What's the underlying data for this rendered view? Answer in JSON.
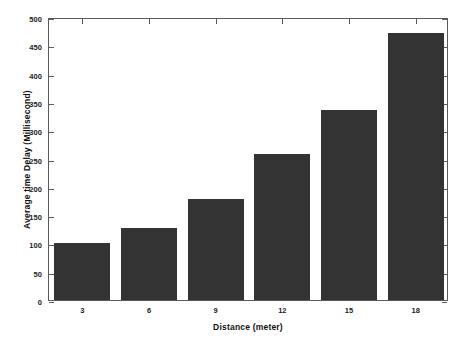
{
  "chart_data": {
    "type": "bar",
    "title": "",
    "xlabel": "Distance (meter)",
    "ylabel": "Average time Delay (Millisecond)",
    "categories": [
      "3",
      "6",
      "9",
      "12",
      "15",
      "18"
    ],
    "values": [
      100,
      128,
      178,
      258,
      335,
      472
    ],
    "series": [
      {
        "name": "Average time Delay",
        "values": [
          100,
          128,
          178,
          258,
          335,
          472
        ]
      }
    ],
    "ylim": [
      0,
      500
    ],
    "yticks": [
      0,
      50,
      100,
      150,
      200,
      250,
      300,
      350,
      400,
      450,
      500
    ],
    "ytick_labels": [
      "0",
      "50",
      "100",
      "150",
      "200",
      "250",
      "300",
      "350",
      "400",
      "450",
      "500"
    ],
    "xtick_labels": [
      "3",
      "6",
      "9",
      "12",
      "15",
      "18"
    ],
    "grid": false,
    "legend": null,
    "bar_color": "#333333",
    "axis_color": "#5a5a5a",
    "background_color": "#ffffff",
    "bar_width_ratio": 0.84
  }
}
